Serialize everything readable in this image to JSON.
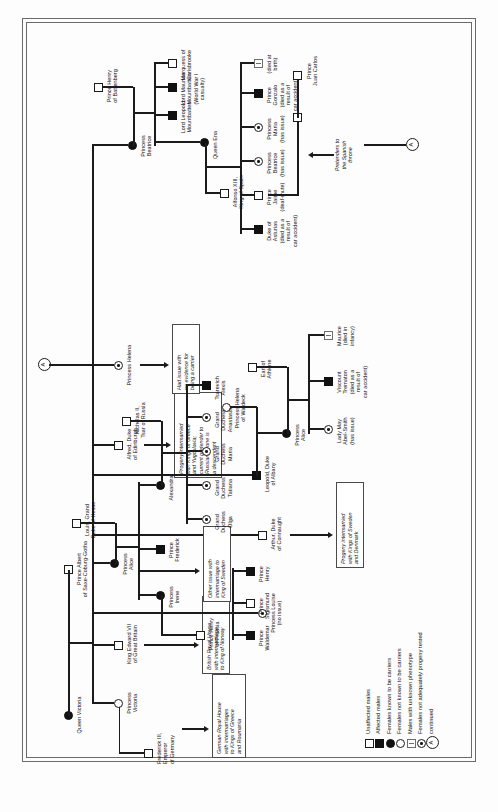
{
  "document": {
    "type": "pedigree-chart",
    "subject": "Haemophilia in the royal families of Europe",
    "connector_label": "A"
  },
  "legend": {
    "items": [
      {
        "symbol": "open-square",
        "label": "Unaffected males"
      },
      {
        "symbol": "filled-square",
        "label": "Affected males"
      },
      {
        "symbol": "filled-circle",
        "label": "Females known to be carriers"
      },
      {
        "symbol": "open-circle",
        "label": "Females not known to be carriers"
      },
      {
        "symbol": "question-square",
        "label": "Males with unknown phenotype"
      },
      {
        "symbol": "dotted-circle",
        "label": "Females not adequately progeny tested"
      },
      {
        "symbol": "circle-a",
        "label": "continued"
      }
    ],
    "connector_glyph": "A"
  },
  "people": {
    "queen_victoria": "Queen Victoria",
    "prince_albert": "Prince Albert\nof Saxe-Coburg-Gotha",
    "frederick_iii": "Frederick III,\nEmperor\nof Germany",
    "princess_victoria": "Princess\nVictoria",
    "king_edward_vii": "King Edward VII\nof Great Britain",
    "princess_alice": "Princess\nAlice",
    "louis_hesse": "Louis, Grand\nDuke of Hesse",
    "alfred_edinburgh": "Alfred, Duke\nof Edinburgh",
    "princess_helena": "Princess Helena",
    "princess_louise": "Princess Louise\n(no issue)",
    "arthur_connaught": "Arthur, Duke\nof Connaught",
    "leopold_albany": "Leopold, Duke\nof Albany",
    "princess_beatrice": "Princess\nBeatrice",
    "prince_henry_batt": "Prince Henry\nof Battenberg",
    "prince_henry_prussia": "Prince Henry\nof Prussia",
    "princess_irene": "Princess\nIrene",
    "prince_frederick": "Prince\nFrederick",
    "alexandra": "Alexandra",
    "nicholas_ii": "Nicholas II,\nTsar of Russia",
    "prince_waldemar": "Prince\nWaldemar",
    "prince_sigismund": "Prince\nSigismund",
    "prince_henry": "Prince\nHenry",
    "gd_olga": "Grand\nDuchess\nOlga",
    "gd_tatiana": "Grand\nDuchess\nTatiana",
    "gd_maria": "Grand\nDuchess\nMaria",
    "gd_anastasia": "Grand\nDuchess\nAnastasia",
    "tsarevich_alexis": "Tsarevich\nAlexis",
    "princess_helena_waldeck": "Princess Helena\nof Waldeck",
    "princess_alice_ath": "Princess\nAlice",
    "earl_athlone": "Earl of\nAthlone",
    "maurice": "Maurice\n(died in\ninfancy)",
    "lady_may": "Lady May\nAbel-Smith\n(has issue)",
    "viscount_trematon": "Viscount\nTrematon\n(died as a\nresult of\ncar accident)",
    "queen_ena": "Queen Ena",
    "alfonso_xiii": "Alfonso XIII,\nKing of Spain",
    "lord_leopold": "Lord Leopold\nMountbatten",
    "lord_maurice": "Lord Maurice\nMountbatten\n(World War I\ncasualty)",
    "marquess_carisbrooke": "Marquess of\nCarisbrooke",
    "duke_asturias": "Duke of\nAsturias\n(died as a\nresult of\ncar accident)",
    "prince_jaime": "Prince\nJaime\n(deaf-mute)",
    "princess_beatrice_sp": "Princess\nBeatrice\n(has issue)",
    "princess_maria": "Princess\nMaria\n(has issue)",
    "prince_gonzalo": "Prince\nGonzalo\n(died as a\nresult of\ncar accident)",
    "died_at_birth": "(died at\nbirth)",
    "prince_juan_carlos": "Prince\nJuan Carlos"
  },
  "notes": {
    "german_royal_house": "German Royal House\nwith intermarriages\nto Kings of Greece\nand Roumania",
    "british_royal_house": "British Royal House\nwith intermarriage\nto King of Norway",
    "other_issue_sweden": "Other issue with\nintermarriage to\nKing of Sweden",
    "progeny_russia": "Progeny intermarried\nwith Kings of Greece\nand Yugoslavia;\ncurrent pretender to\nRussian throne is\na descendent",
    "helena_no_issue": "Had issue with\nno evidence for\nbeing a carrier",
    "progeny_denmark": "Progeny intermarried\nwith Kings of Sweden\nand Denmark",
    "pretenders_spain": "Pretenders to\nthe Spanish\nthrone"
  },
  "colors": {
    "ink": "#111111",
    "rule": "#6b6b6b",
    "paper": "#fdfdfd"
  }
}
